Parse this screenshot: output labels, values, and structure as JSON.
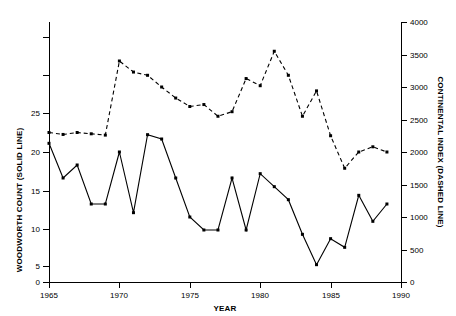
{
  "chart_data": {
    "type": "line",
    "title": "",
    "xlabel": "YEAR",
    "ylabel": "WOODWORTH COUNT (SOLID LINE)",
    "y2label": "CONTINENTAL INDEX (DASHED LINE)",
    "grid": false,
    "legend": "none",
    "x": [
      1965,
      1966,
      1967,
      1968,
      1969,
      1970,
      1971,
      1972,
      1973,
      1974,
      1975,
      1976,
      1977,
      1978,
      1979,
      1980,
      1981,
      1982,
      1983,
      1984,
      1985,
      1986,
      1987,
      1988,
      1989
    ],
    "xlim": [
      1965,
      1990
    ],
    "xticks": [
      1965,
      1970,
      1975,
      1980,
      1985,
      1990
    ],
    "xticklabels": [
      "1965",
      "1970",
      "1975",
      "1980",
      "1985",
      "1990"
    ],
    "ylim": [
      0,
      30
    ],
    "yticks": [
      0,
      5,
      10,
      15,
      20,
      25
    ],
    "yticklabels": [
      "0",
      "5",
      "10",
      "15",
      "20",
      "25"
    ],
    "y2lim": [
      0,
      4000
    ],
    "y2ticks": [
      0,
      500,
      1000,
      1500,
      2000,
      2500,
      3000,
      3500,
      4000
    ],
    "y2ticklabels": [
      "0",
      "500",
      "1000",
      "1500",
      "2000",
      "2500",
      "3000",
      "3500",
      "4000"
    ],
    "series": [
      {
        "name": "WOODWORTH COUNT (SOLID LINE)",
        "axis": "left",
        "style": "solid",
        "marker": "filled-square",
        "color": "#000000",
        "values": [
          16,
          12,
          13.5,
          9,
          9,
          15,
          8,
          17,
          16.5,
          12,
          7.5,
          6,
          6,
          12,
          6,
          12.5,
          11,
          9.5,
          5.5,
          2,
          5,
          4,
          10,
          7,
          9
        ]
      },
      {
        "name": "CONTINENTAL INDEX (DASHED LINE)",
        "axis": "right",
        "style": "dashed",
        "marker": "filled-square",
        "color": "#000000",
        "values": [
          2300,
          2270,
          2300,
          2280,
          2260,
          3400,
          3230,
          3180,
          3000,
          2830,
          2700,
          2730,
          2550,
          2620,
          3130,
          3020,
          3550,
          3180,
          2550,
          2940,
          2250,
          1750,
          2000,
          2080,
          2000
        ]
      }
    ]
  },
  "axes": {
    "left_title": "WOODWORTH COUNT (SOLID LINE)",
    "right_title": "CONTINENTAL INDEX (DASHED LINE)",
    "x_title": "YEAR"
  }
}
